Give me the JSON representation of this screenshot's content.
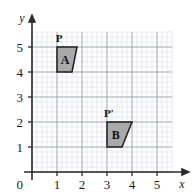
{
  "figure": {
    "background_color": "#ffffff",
    "grid": {
      "minor_color": "#d9dce6",
      "major_color": "#9aa0ad",
      "minor_step": 0.2,
      "major_step": 1
    },
    "axes": {
      "color": "#2b2b2b",
      "x_name": "x",
      "y_name": "y",
      "origin_label": "0",
      "x_min": 0,
      "x_max": 5.6,
      "y_min": 0,
      "y_max": 5.6,
      "x_ticks": [
        1,
        2,
        3,
        4,
        5
      ],
      "y_ticks": [
        1,
        2,
        3,
        4,
        5
      ],
      "x_tick_labels": [
        "1",
        "2",
        "3",
        "4",
        "5"
      ],
      "y_tick_labels": [
        "1",
        "2",
        "3",
        "4",
        "5"
      ]
    },
    "shapes": [
      {
        "id": "A",
        "label": "A",
        "vertex_label": "P",
        "fill": "#a9a9a9",
        "stroke": "#1c1c1c",
        "points": [
          [
            1,
            5
          ],
          [
            1.8,
            5
          ],
          [
            1.6,
            4
          ],
          [
            1,
            4
          ]
        ],
        "label_point": [
          1.32,
          4.5
        ],
        "vertex_label_point": [
          1.0,
          5.0
        ]
      },
      {
        "id": "B",
        "label": "B",
        "vertex_label": "P′",
        "fill": "#a9a9a9",
        "stroke": "#1c1c1c",
        "points": [
          [
            3,
            2
          ],
          [
            4,
            2
          ],
          [
            3.6,
            1
          ],
          [
            3,
            1
          ]
        ],
        "label_point": [
          3.35,
          1.5
        ],
        "vertex_label_point": [
          3.0,
          2.0
        ]
      }
    ]
  },
  "chart_data": {
    "type": "scatter",
    "title": "",
    "xlabel": "x",
    "ylabel": "y",
    "xlim": [
      0,
      5.6
    ],
    "ylim": [
      0,
      5.6
    ],
    "grid": true,
    "legend": "none",
    "series": [
      {
        "name": "A",
        "annotation": "P",
        "x": [
          1,
          1.8,
          1.6,
          1
        ],
        "y": [
          5,
          5,
          4,
          4
        ]
      },
      {
        "name": "B",
        "annotation": "P′",
        "x": [
          3,
          4,
          3.6,
          3
        ],
        "y": [
          2,
          2,
          1,
          1
        ]
      }
    ]
  }
}
